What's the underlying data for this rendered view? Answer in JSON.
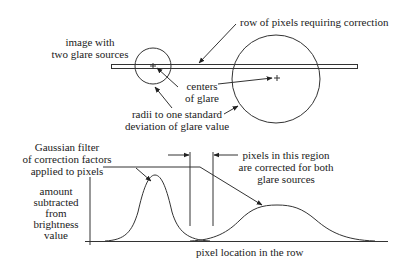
{
  "top": {
    "image_label": [
      "image with",
      "two glare sources"
    ],
    "row_label": "row of pixels requiring correction",
    "centers_label": [
      "centers",
      "of glare"
    ],
    "radii_label": [
      "radii to one standard",
      "deviation of glare value"
    ]
  },
  "bottom": {
    "filter_label": [
      "Gaussian filter",
      "of correction factors",
      "applied to pixels"
    ],
    "region_label": [
      "pixels in this region",
      "are corrected for both",
      "glare sources"
    ],
    "y_axis_label": [
      "amount",
      "subtracted",
      "from",
      "brightness",
      "value"
    ],
    "x_axis_label": "pixel location in the row"
  },
  "colors": {
    "line": "#333333",
    "text": "#1a1a1a"
  }
}
